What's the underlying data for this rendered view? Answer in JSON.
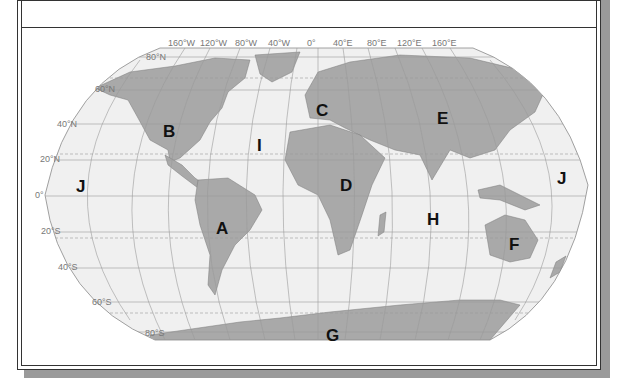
{
  "figure": {
    "projection": "Robinson",
    "colors": {
      "ocean": "#f0f0f0",
      "land": "#a9a9a9",
      "grid": "#9a9a9a",
      "frame": "#333333",
      "shadow": "#9a9a9a"
    }
  },
  "longitude_labels": [
    "160°W",
    "120°W",
    "80°W",
    "40°W",
    "0°",
    "40°E",
    "80°E",
    "120°E",
    "160°E"
  ],
  "latitude_labels": [
    "80°N",
    "60°N",
    "40°N",
    "20°N",
    "0°",
    "20°S",
    "40°S",
    "60°S",
    "80°S"
  ],
  "regions": [
    {
      "letter": "A",
      "x": 222,
      "y": 228
    },
    {
      "letter": "B",
      "x": 170,
      "y": 131
    },
    {
      "letter": "C",
      "x": 322,
      "y": 110
    },
    {
      "letter": "D",
      "x": 347,
      "y": 185
    },
    {
      "letter": "E",
      "x": 444,
      "y": 118
    },
    {
      "letter": "F",
      "x": 515,
      "y": 244
    },
    {
      "letter": "G",
      "x": 333,
      "y": 335
    },
    {
      "letter": "H",
      "x": 434,
      "y": 219
    },
    {
      "letter": "I",
      "x": 260,
      "y": 145
    },
    {
      "letter": "J",
      "x": 81,
      "y": 186
    },
    {
      "letter": "J",
      "x": 563,
      "y": 178
    }
  ]
}
